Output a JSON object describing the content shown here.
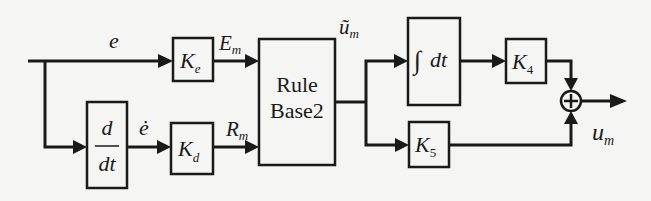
{
  "diagram": {
    "type": "block-diagram",
    "signals": {
      "error": "e",
      "error_dot": "ė",
      "em": {
        "base": "E",
        "sub": "m"
      },
      "rm": {
        "base": "R",
        "sub": "m"
      },
      "um_tilde": {
        "base": "ũ",
        "sub": "m"
      },
      "um": {
        "base": "u",
        "sub": "m"
      }
    },
    "blocks": {
      "ke": {
        "base": "K",
        "sub": "e"
      },
      "kd": {
        "base": "K",
        "sub": "d"
      },
      "derivative": {
        "num": "d",
        "den": "dt"
      },
      "rule_base": {
        "line1": "Rule",
        "line2": "Base2"
      },
      "integral": {
        "sym": "∫",
        "text": "dt"
      },
      "k4": {
        "base": "K",
        "sub": "4"
      },
      "k5": {
        "base": "K",
        "sub": "5"
      }
    },
    "sum_junction": "+"
  }
}
